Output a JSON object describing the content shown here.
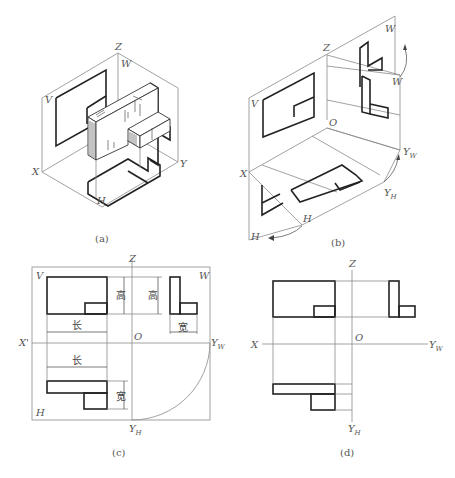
{
  "figure": {
    "panels": [
      {
        "id": "a",
        "caption": "(a)",
        "title": "Three-projection-plane isometric view of object",
        "axis_labels": {
          "x": "X",
          "y": "Y",
          "z": "Z"
        },
        "plane_labels": {
          "v": "V",
          "w": "W",
          "h": "H"
        }
      },
      {
        "id": "b",
        "caption": "(b)",
        "title": "Unfolding projection planes",
        "axis_labels": {
          "x": "X",
          "z": "Z",
          "o": "O",
          "yw": "Y",
          "yw_sub": "W",
          "yh": "Y",
          "yh_sub": "H"
        },
        "plane_labels": {
          "v": "V",
          "w_top": "W",
          "w_rotated": "W",
          "h_rotated": "H",
          "h_bottom": "H"
        }
      },
      {
        "id": "c",
        "caption": "(c)",
        "title": "Unfolded three views with dimensions",
        "axis_labels": {
          "x": "X'",
          "z": "Z",
          "o": "O",
          "yw": "Y",
          "yw_sub": "W",
          "yh": "Y",
          "yh_sub": "H"
        },
        "plane_labels": {
          "v": "V",
          "w": "W",
          "h": "H"
        },
        "dimensions": {
          "front_height": "高",
          "side_height": "高",
          "side_width": "宽",
          "front_length": "长",
          "top_length": "长",
          "top_width": "宽"
        }
      },
      {
        "id": "d",
        "caption": "(d)",
        "title": "Three views without projection plane borders",
        "axis_labels": {
          "x": "X",
          "z": "Z",
          "o": "O",
          "yw": "Y",
          "yw_sub": "W",
          "yh": "Y",
          "yh_sub": "H"
        }
      }
    ]
  }
}
